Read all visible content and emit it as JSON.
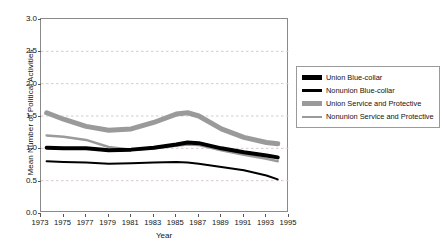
{
  "chart_data": {
    "type": "line",
    "title": "",
    "xlabel": "Year",
    "ylabel": "Mean Number of Political Activities",
    "xlim": [
      1973,
      1995
    ],
    "ylim": [
      0.0,
      3.0
    ],
    "yticks": [
      "0.0",
      "0.5",
      "1.0",
      "1.5",
      "2.0",
      "2.5",
      "3.0"
    ],
    "ytick_values": [
      0.0,
      0.5,
      1.0,
      1.5,
      2.0,
      2.5,
      3.0
    ],
    "xticks": [
      "1973",
      "1975",
      "1977",
      "1979",
      "1981",
      "1983",
      "1985",
      "1987",
      "1989",
      "1991",
      "1993",
      "1995"
    ],
    "xtick_values": [
      1973,
      1975,
      1977,
      1979,
      1981,
      1983,
      1985,
      1987,
      1989,
      1991,
      1993,
      1995
    ],
    "grid": "horizontal dashed light gray at 0.5 intervals",
    "legend_position": "right, outside plot",
    "x": [
      1973.5,
      1975,
      1977,
      1979,
      1981,
      1983,
      1985,
      1986,
      1987,
      1989,
      1991,
      1993,
      1994
    ],
    "series": [
      {
        "name": "Union Blue-collar",
        "color": "#000000",
        "width": 4,
        "values": [
          1.01,
          1.0,
          1.0,
          0.97,
          0.98,
          1.01,
          1.06,
          1.09,
          1.08,
          1.0,
          0.94,
          0.89,
          0.86
        ]
      },
      {
        "name": "Nonunion Blue-collar",
        "color": "#000000",
        "width": 2,
        "values": [
          0.8,
          0.79,
          0.78,
          0.76,
          0.77,
          0.78,
          0.79,
          0.78,
          0.76,
          0.71,
          0.66,
          0.58,
          0.52
        ]
      },
      {
        "name": "Union Service and Protective",
        "color": "#9a9a9a",
        "width": 5,
        "values": [
          1.55,
          1.45,
          1.34,
          1.28,
          1.3,
          1.4,
          1.53,
          1.55,
          1.5,
          1.3,
          1.17,
          1.09,
          1.07
        ]
      },
      {
        "name": "Nonunion Service and Protective",
        "color": "#9a9a9a",
        "width": 2.5,
        "values": [
          1.2,
          1.18,
          1.13,
          1.02,
          0.98,
          1.0,
          1.04,
          1.06,
          1.05,
          0.97,
          0.9,
          0.84,
          0.8
        ]
      }
    ]
  },
  "legend": {
    "items": [
      {
        "label": "Union Blue-collar",
        "color": "#000000",
        "thickness": 5
      },
      {
        "label": "Nonunion Blue-collar",
        "color": "#000000",
        "thickness": 3
      },
      {
        "label": "Union Service and Protective",
        "color": "#9a9a9a",
        "thickness": 5
      },
      {
        "label": "Nonunion Service and Protective",
        "color": "#9a9a9a",
        "thickness": 2
      }
    ]
  },
  "colors": {
    "black_series": "#000000",
    "gray_series": "#9a9a9a",
    "gridline": "#d8c9c9",
    "frame": "#8a8a8a",
    "background": "#ffffff"
  }
}
